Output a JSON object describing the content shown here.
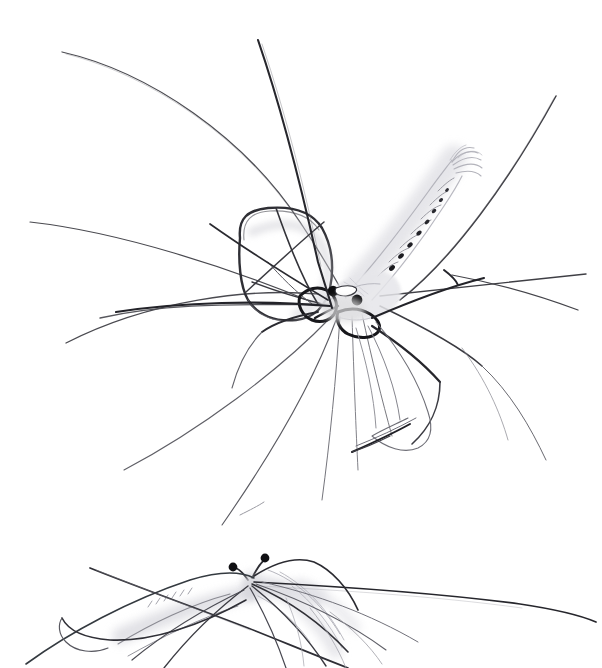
{
  "image": {
    "kind": "pencil-drawing",
    "medium": "graphite pencil on white paper",
    "subject": "crane fly",
    "subject_alt": "long-legged mosquito-like insect",
    "title": "Crane Fly Study",
    "background_color": "#ffffff",
    "width": 602,
    "height": 668,
    "figure_count": 2,
    "palette": {
      "paper": "#ffffff",
      "darkest_line": "#18181a",
      "strong_line": "#2b2b2e",
      "mid_line": "#5a5a60",
      "light_line": "#9a9aa2",
      "faint_wash": "#c9c9d0",
      "ghost_wash": "#e2e2e7",
      "eye_fill": "#0d0d0f"
    },
    "figures": [
      {
        "id": "upper-figure",
        "label": "Upper crane fly — detailed study",
        "position": "upper two thirds, body centered near x 355 y 295",
        "rendering": "fully drawn, strongest contrast",
        "parts": [
          "segmented abdomen with banded rings and dark dorsal spots",
          "feathered fan-shaped abdomen tip",
          "rounded rectangular folded wing at left of thorax",
          "compact dark thorax and head",
          "two dark rounded eyes",
          "short pointed rostrum",
          "six extremely long slender legs radiating outward",
          "second wing hanging low beneath the body"
        ]
      },
      {
        "id": "lower-figure",
        "label": "Lower crane fly — lighter repeated sketch, cropped by page edge",
        "position": "bottom band, body centered near x 255 y 600",
        "rendering": "lighter, looser, partially cut off at bottom edge",
        "parts": [
          "two stalked dark eyes on short peduncles",
          "pale washed thorax and abdomen in profile",
          "long sweeping legs crossing the frame",
          "ghosted wing outline to the right of thorax"
        ]
      }
    ],
    "annotations": {
      "text_present": false,
      "signature_present": false,
      "caption": "Two graphite sketches of a crane fly on blank white paper"
    }
  }
}
